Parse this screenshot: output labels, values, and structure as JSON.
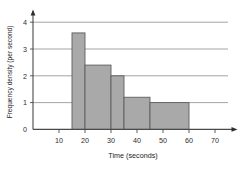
{
  "chart_data": {
    "type": "bar",
    "title": "",
    "xlabel": "Time (seconds)",
    "ylabel": "Frequency density (per second)",
    "xlim": [
      0,
      75
    ],
    "ylim": [
      0,
      4.4
    ],
    "xticks": [
      10,
      20,
      30,
      40,
      50,
      60,
      70
    ],
    "yticks": [
      0,
      1,
      2,
      3,
      4
    ],
    "grid": true,
    "grid_axis": "y",
    "legend": null,
    "bar_style": {
      "fill": "#a9a9a9",
      "edge": "#5e5e5e"
    },
    "bins": [
      {
        "label": "15-20",
        "x_start": 15,
        "x_end": 20,
        "value": 3.6
      },
      {
        "label": "20-30",
        "x_start": 20,
        "x_end": 30,
        "value": 2.4
      },
      {
        "label": "30-35",
        "x_start": 30,
        "x_end": 35,
        "value": 2.0
      },
      {
        "label": "35-45",
        "x_start": 35,
        "x_end": 45,
        "value": 1.2
      },
      {
        "label": "45-60",
        "x_start": 45,
        "x_end": 60,
        "value": 1.0
      }
    ]
  },
  "labels": {
    "x_axis_title": "Time (seconds)",
    "y_axis_title": "Frequency density (per second)",
    "xtick_10": "10",
    "xtick_20": "20",
    "xtick_30": "30",
    "xtick_40": "40",
    "xtick_50": "50",
    "xtick_60": "60",
    "xtick_70": "70",
    "ytick_0": "0",
    "ytick_1": "1",
    "ytick_2": "2",
    "ytick_3": "3",
    "ytick_4": "4"
  }
}
